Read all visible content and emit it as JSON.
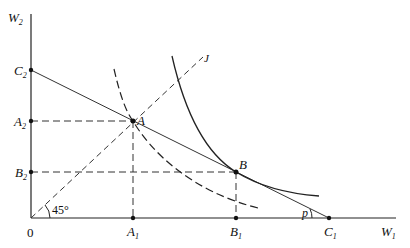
{
  "diagram": {
    "axes": {
      "y_label": "W",
      "y_sub": "2",
      "x_label": "W",
      "x_sub": "1",
      "origin_label": "0"
    },
    "points": {
      "C2": {
        "label": "C",
        "sub": "2"
      },
      "A2": {
        "label": "A",
        "sub": "2"
      },
      "B2": {
        "label": "B",
        "sub": "2"
      },
      "A1": {
        "label": "A",
        "sub": "1"
      },
      "B1": {
        "label": "B",
        "sub": "1"
      },
      "C1": {
        "label": "C",
        "sub": "1"
      },
      "A": {
        "label": "A"
      },
      "B": {
        "label": "B"
      }
    },
    "ray_label": "J",
    "angle_label": "45°",
    "price_angle_label": "p"
  }
}
